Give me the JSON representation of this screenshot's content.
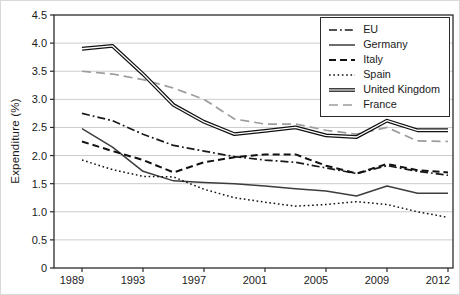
{
  "chart_data": {
    "type": "line",
    "title": "",
    "xlabel": "",
    "ylabel": "Expenditure (%)",
    "ylim": [
      0,
      4.5
    ],
    "grid": "horizontal-light",
    "legend_position": "top-right-inside",
    "background": "#ffffff",
    "frame": true,
    "ytick_values": [
      0,
      0.5,
      1.0,
      1.5,
      2.0,
      2.5,
      3.0,
      3.5,
      4.0,
      4.5
    ],
    "ytick_labels": [
      "0",
      "0.5",
      "1.0",
      "1.5",
      "2.0",
      "2.5",
      "3.0",
      "3.5",
      "4.0",
      "4.5"
    ],
    "x_categories": [
      1989,
      1991,
      1993,
      1995,
      1997,
      1999,
      2001,
      2003,
      2005,
      2007,
      2009,
      2011,
      2012
    ],
    "x_tick_labels": [
      "1989",
      "1993",
      "1997",
      "2001",
      "2005",
      "2009",
      "2012"
    ],
    "series": [
      {
        "name": "EU",
        "style": "dashdot",
        "color": "#1a1a1a",
        "values": [
          2.75,
          2.62,
          2.38,
          2.18,
          2.08,
          1.98,
          1.92,
          1.88,
          1.78,
          1.68,
          1.82,
          1.72,
          1.65
        ]
      },
      {
        "name": "Germany",
        "style": "solid",
        "color": "#3d3d3d",
        "values": [
          2.48,
          2.15,
          1.72,
          1.55,
          1.52,
          1.5,
          1.46,
          1.41,
          1.37,
          1.28,
          1.46,
          1.33,
          1.33
        ]
      },
      {
        "name": "Italy",
        "style": "dashed",
        "color": "#111111",
        "values": [
          2.25,
          2.08,
          1.92,
          1.7,
          1.88,
          1.97,
          2.02,
          2.02,
          1.82,
          1.68,
          1.85,
          1.74,
          1.7
        ]
      },
      {
        "name": "Spain",
        "style": "dotted",
        "color": "#111111",
        "values": [
          1.92,
          1.75,
          1.63,
          1.62,
          1.4,
          1.25,
          1.17,
          1.1,
          1.13,
          1.18,
          1.13,
          1.0,
          0.9
        ]
      },
      {
        "name": "United Kingdom",
        "style": "double",
        "color": "#111111",
        "values": [
          3.9,
          3.95,
          3.45,
          2.9,
          2.6,
          2.38,
          2.44,
          2.5,
          2.36,
          2.33,
          2.62,
          2.45,
          2.45
        ]
      },
      {
        "name": "France",
        "style": "longdash",
        "color": "#9c9c9c",
        "values": [
          3.5,
          3.45,
          3.35,
          3.2,
          3.0,
          2.65,
          2.56,
          2.56,
          2.45,
          2.38,
          2.5,
          2.26,
          2.25
        ]
      }
    ]
  }
}
